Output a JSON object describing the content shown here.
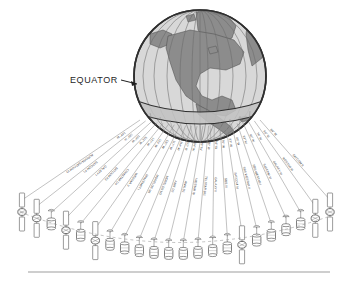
{
  "figure": {
    "type": "technical-illustration",
    "background_color": "#ffffff",
    "ink_color": "#3a3a3a",
    "land_fill": "#8c8c8c",
    "ocean_fill": "#d8d8d8",
    "equator_band_fill": "#c2c2c2"
  },
  "annotations": {
    "equator_label": "EQUATOR",
    "equator_arrow": "arrow-right-icon"
  },
  "globe": {
    "center_meridian_label": "",
    "features": [
      "North America",
      "Greenland",
      "Alaska",
      "Canada",
      "Mexico",
      "Caribbean",
      "Central America",
      "South America (north)"
    ],
    "graticule": {
      "meridians": 9,
      "equator": true
    }
  },
  "orbital_arc": {
    "caption": "",
    "satellites": [
      {
        "name": "AURORA (SATCOM V)",
        "longitude": "143° W",
        "body": "panel"
      },
      {
        "name": "SATCOM F1",
        "longitude": "139° W",
        "body": "panel"
      },
      {
        "name": "GALAXY I",
        "longitude": "134° W",
        "body": "drum"
      },
      {
        "name": "SATCOM F3",
        "longitude": "131° W",
        "body": "panel"
      },
      {
        "name": "COMSTAR D4",
        "longitude": "127° W",
        "body": "drum"
      },
      {
        "name": "WESTAR V",
        "longitude": "123° W",
        "body": "panel"
      },
      {
        "name": "SPACENET I",
        "longitude": "120° W",
        "body": "drum"
      },
      {
        "name": "MORELOS M1",
        "longitude": "117° W",
        "body": "drum"
      },
      {
        "name": "MORELOS M2",
        "longitude": "114° W",
        "body": "drum"
      },
      {
        "name": "ANIK D2",
        "longitude": "111° W",
        "body": "drum"
      },
      {
        "name": "ANIK D1",
        "longitude": "104° W",
        "body": "drum"
      },
      {
        "name": "WESTAR IV",
        "longitude": "99° W",
        "body": "drum"
      },
      {
        "name": "TELSTAR 301",
        "longitude": "96° W",
        "body": "drum"
      },
      {
        "name": "GALAXY II",
        "longitude": "93° W",
        "body": "drum"
      },
      {
        "name": "SBS III",
        "longitude": "91° W",
        "body": "drum"
      },
      {
        "name": "SATCOM IV",
        "longitude": "87° W",
        "body": "panel"
      },
      {
        "name": "SBS WESTAR II",
        "longitude": "85° W",
        "body": "drum"
      },
      {
        "name": "SBS WESTAR I",
        "longitude": "83° W",
        "body": "drum"
      },
      {
        "name": "SATCOM III",
        "longitude": "81° W",
        "body": "drum"
      },
      {
        "name": "GALAXY III",
        "longitude": "74° W",
        "body": "drum"
      },
      {
        "name": "WESTAR III",
        "longitude": "69° W",
        "body": "panel"
      },
      {
        "name": "SATCOM II",
        "longitude": "64° W",
        "body": "panel"
      }
    ]
  }
}
